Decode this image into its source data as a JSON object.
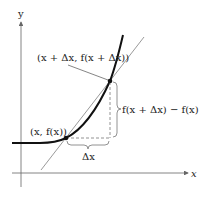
{
  "diagram": {
    "axes": {
      "x_label": "x",
      "y_label": "y",
      "axis_color": "#555555"
    },
    "curve": {
      "color": "#111111",
      "description": "increasing convex function f"
    },
    "secant": {
      "color": "#999999"
    },
    "points": [
      {
        "label": "(x, f(x))",
        "name": "point-x"
      },
      {
        "label": "(x + Δx, f(x + Δx))",
        "name": "point-x-plus-dx"
      }
    ],
    "annotations": {
      "delta_x": "Δx",
      "delta_y": "f(x + Δx) − f(x)"
    }
  }
}
